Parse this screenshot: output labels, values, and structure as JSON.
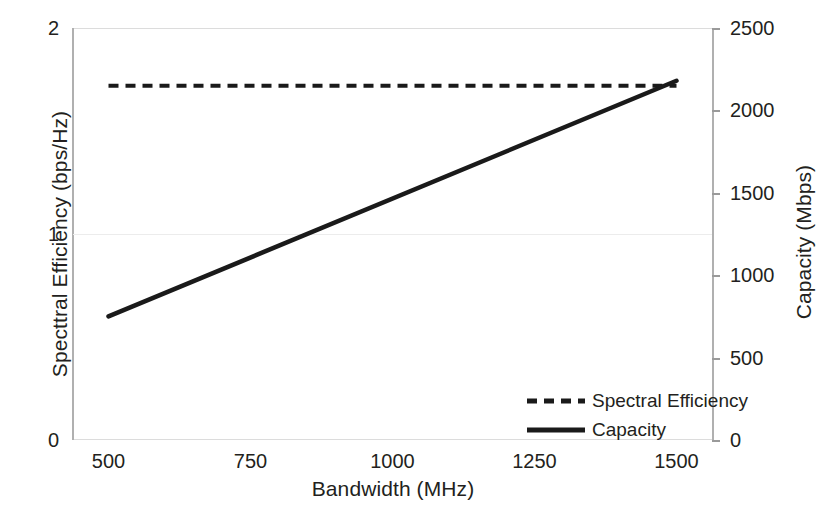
{
  "chart_data": {
    "type": "line",
    "title": "",
    "xlabel": "Bandwidth (MHz)",
    "ylabel": "Specttral Efficiency (bps/Hz)",
    "ylabel_right": "Capacity (Mbps)",
    "xlim": [
      437.5,
      1562.5
    ],
    "ylim": [
      0,
      2
    ],
    "ylim_right": [
      0,
      2500
    ],
    "xticks": [
      500,
      750,
      1000,
      1250,
      1500
    ],
    "xtick_labels": [
      "500",
      "750",
      "1000",
      "1250",
      "1500"
    ],
    "yticks": [
      0,
      1,
      2
    ],
    "ytick_labels": [
      "0",
      "1",
      "2"
    ],
    "yticks_right": [
      0,
      500,
      1000,
      1500,
      2000,
      2500
    ],
    "ytick_labels_right": [
      "0",
      "500",
      "1000",
      "1500",
      "2000",
      "2500"
    ],
    "grid": true,
    "legend_position": "lower right",
    "series": [
      {
        "name": "Spectral Efficiency",
        "axis": "left",
        "style": "dashed",
        "color": "#1a1a1a",
        "x": [
          500,
          1500
        ],
        "values": [
          1.72,
          1.72
        ]
      },
      {
        "name": "Capacity",
        "axis": "right",
        "style": "solid",
        "color": "#1a1a1a",
        "x": [
          500,
          1500
        ],
        "values": [
          750,
          2180
        ]
      }
    ],
    "legend": [
      "Spectral Efficiency",
      "Capacity"
    ],
    "colors": {
      "line": "#1a1a1a",
      "axis": "#b0b0b0",
      "grid": "#ececec",
      "text": "#231f20",
      "background": "#ffffff"
    }
  }
}
